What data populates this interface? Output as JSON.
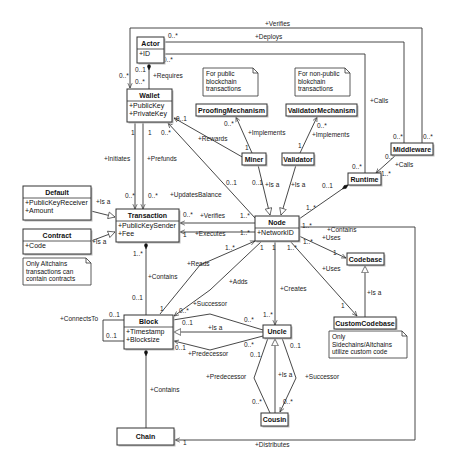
{
  "diagram": {
    "type": "UML class diagram",
    "classes": [
      {
        "id": "actor",
        "name": "Actor",
        "attributes": [
          "+ID"
        ],
        "x": 137,
        "y": 37,
        "w": 27,
        "h": 26
      },
      {
        "id": "wallet",
        "name": "Wallet",
        "attributes": [
          "+PublicKey",
          "+PrivateKey"
        ],
        "x": 127,
        "y": 89,
        "w": 45,
        "h": 33
      },
      {
        "id": "proofing",
        "name": "ProofingMechanism",
        "attributes": [],
        "x": 196,
        "y": 104,
        "w": 71,
        "h": 12
      },
      {
        "id": "validatormech",
        "name": "ValidatorMechanism",
        "attributes": [],
        "x": 286,
        "y": 104,
        "w": 71,
        "h": 12
      },
      {
        "id": "miner",
        "name": "Miner",
        "attributes": [],
        "x": 242,
        "y": 153,
        "w": 24,
        "h": 12
      },
      {
        "id": "validator",
        "name": "Validator",
        "attributes": [],
        "x": 282,
        "y": 153,
        "w": 32,
        "h": 12
      },
      {
        "id": "middleware",
        "name": "Middleware",
        "attributes": [],
        "x": 391,
        "y": 143,
        "w": 42,
        "h": 12
      },
      {
        "id": "runtime",
        "name": "Runtime",
        "attributes": [],
        "x": 348,
        "y": 173,
        "w": 33,
        "h": 12
      },
      {
        "id": "default",
        "name": "Default",
        "attributes": [
          "+PublicKeyReceiver",
          "+Amount"
        ],
        "x": 23,
        "y": 186,
        "w": 68,
        "h": 34
      },
      {
        "id": "transaction",
        "name": "Transaction",
        "attributes": [
          "+PublicKeySender",
          "+Fee"
        ],
        "x": 116,
        "y": 209,
        "w": 63,
        "h": 33
      },
      {
        "id": "contract",
        "name": "Contract",
        "attributes": [
          "+Code"
        ],
        "x": 23,
        "y": 229,
        "w": 68,
        "h": 25
      },
      {
        "id": "node",
        "name": "Node",
        "attributes": [
          "+NetworkID"
        ],
        "x": 255,
        "y": 216,
        "w": 44,
        "h": 25
      },
      {
        "id": "codebase",
        "name": "Codebase",
        "attributes": [],
        "x": 347,
        "y": 253,
        "w": 37,
        "h": 12
      },
      {
        "id": "customcodebase",
        "name": "CustomCodebase",
        "attributes": [],
        "x": 334,
        "y": 317,
        "w": 62,
        "h": 12
      },
      {
        "id": "block",
        "name": "Block",
        "attributes": [
          "+Timestamp",
          "+Blocksize"
        ],
        "x": 124,
        "y": 315,
        "w": 49,
        "h": 34
      },
      {
        "id": "uncle",
        "name": "Uncle",
        "attributes": [],
        "x": 263,
        "y": 325,
        "w": 28,
        "h": 13
      },
      {
        "id": "cousin",
        "name": "Cousin",
        "attributes": [],
        "x": 261,
        "y": 413,
        "w": 27,
        "h": 13
      },
      {
        "id": "chain",
        "name": "Chain",
        "attributes": [],
        "x": 117,
        "y": 428,
        "w": 57,
        "h": 17
      }
    ],
    "notes": [
      {
        "id": "note-public",
        "lines": [
          "For public",
          "blockchain",
          "transactions"
        ],
        "x": 203,
        "y": 68,
        "w": 55,
        "h": 28
      },
      {
        "id": "note-nonpublic",
        "lines": [
          "For non-public",
          "blokchain",
          "transactions"
        ],
        "x": 295,
        "y": 68,
        "w": 55,
        "h": 28
      },
      {
        "id": "note-altchains",
        "lines": [
          "Only Altchains",
          "transactions can",
          "contain contracts"
        ],
        "x": 23,
        "y": 258,
        "w": 68,
        "h": 27
      },
      {
        "id": "note-sidechains",
        "lines": [
          "Only",
          "Sidechains/Altchains",
          "utilize custom code"
        ],
        "x": 329,
        "y": 331,
        "w": 78,
        "h": 27
      }
    ],
    "edges": [
      {
        "id": "verifies-top",
        "label": "+Verifies",
        "label_x": 265,
        "label_y": 26,
        "mults": [
          {
            "t": "0..*",
            "x": 168,
            "y": 38
          },
          {
            "t": "0..*",
            "x": 423,
            "y": 139
          }
        ]
      },
      {
        "id": "deploys",
        "label": "+Deploys",
        "label_x": 255,
        "label_y": 39,
        "mults": [
          {
            "t": "0..*",
            "x": 163,
            "y": 62
          },
          {
            "t": "0..*",
            "x": 393,
            "y": 139
          }
        ]
      },
      {
        "id": "calls-runtime",
        "label": "+Calls",
        "label_x": 370,
        "label_y": 103,
        "mults": [
          {
            "t": "0..*",
            "x": 352,
            "y": 169
          }
        ]
      },
      {
        "id": "calls-mw",
        "label": "+Calls",
        "label_x": 395,
        "label_y": 167,
        "mults": [
          {
            "t": "0..*",
            "x": 385,
            "y": 159
          },
          {
            "t": "1..*",
            "x": 381,
            "y": 176
          }
        ]
      },
      {
        "id": "requires",
        "label": "+Requires",
        "label_x": 153,
        "label_y": 78,
        "mults": [
          {
            "t": "0..1",
            "x": 135,
            "y": 72
          },
          {
            "t": "0..*",
            "x": 135,
            "y": 84
          },
          {
            "t": "0..*",
            "x": 119,
            "y": 78
          }
        ]
      },
      {
        "id": "implements-pm",
        "label": "+Implements",
        "label_x": 248,
        "label_y": 135,
        "mults": [
          {
            "t": "0..*",
            "x": 224,
            "y": 126
          },
          {
            "t": "1",
            "x": 245,
            "y": 150
          }
        ]
      },
      {
        "id": "implements-vm",
        "label": "+Implements",
        "label_x": 312,
        "label_y": 137,
        "mults": [
          {
            "t": "0..*",
            "x": 317,
            "y": 128
          },
          {
            "t": "1",
            "x": 298,
            "y": 148
          }
        ]
      },
      {
        "id": "rewards",
        "label": "+Rewards",
        "label_x": 198,
        "label_y": 141,
        "mults": [
          {
            "t": "0..1",
            "x": 176,
            "y": 121
          },
          {
            "t": "0..1",
            "x": 226,
            "y": 185
          }
        ]
      },
      {
        "id": "initiates",
        "label": "+Initiates",
        "label_x": 104,
        "label_y": 161,
        "mults": [
          {
            "t": "1",
            "x": 131,
            "y": 135
          },
          {
            "t": "0..*",
            "x": 125,
            "y": 198
          }
        ]
      },
      {
        "id": "prefunds",
        "label": "+Prefunds",
        "label_x": 147,
        "label_y": 161,
        "mults": [
          {
            "t": "1",
            "x": 148,
            "y": 135
          },
          {
            "t": "0..*",
            "x": 148,
            "y": 198
          }
        ]
      },
      {
        "id": "updatesbalance",
        "label": "+UpdatesBalance",
        "label_x": 170,
        "label_y": 197,
        "mults": [
          {
            "t": "0..*",
            "x": 161,
            "y": 135
          },
          {
            "t": "0..1",
            "x": 252,
            "y": 185
          }
        ]
      },
      {
        "id": "miner-isa",
        "label": "+Is a",
        "label_x": 265,
        "label_y": 187
      },
      {
        "id": "validator-isa",
        "label": "+Is a",
        "label_x": 291,
        "label_y": 187
      },
      {
        "id": "contains-runtime",
        "label": "+Contains",
        "label_x": 327,
        "label_y": 232,
        "mults": [
          {
            "t": "0..1",
            "x": 322,
            "y": 188
          },
          {
            "t": "1..*",
            "x": 306,
            "y": 210
          }
        ]
      },
      {
        "id": "default-isa",
        "label": "+Is a",
        "label_x": 96,
        "label_y": 204
      },
      {
        "id": "contract-isa",
        "label": "+Is a",
        "label_x": 92,
        "label_y": 244
      },
      {
        "id": "verifies-node",
        "label": "+Verifies",
        "label_x": 200,
        "label_y": 218,
        "mults": [
          {
            "t": "0..*",
            "x": 183,
            "y": 217
          },
          {
            "t": "1..*",
            "x": 240,
            "y": 218
          }
        ]
      },
      {
        "id": "executes",
        "label": "+Executes",
        "label_x": 195,
        "label_y": 236,
        "mults": [
          {
            "t": "1",
            "x": 183,
            "y": 237
          },
          {
            "t": "1..*",
            "x": 240,
            "y": 235
          }
        ]
      },
      {
        "id": "uses-codebase",
        "label": "+Uses",
        "label_x": 322,
        "label_y": 240,
        "mults": [
          {
            "t": "1..*",
            "x": 303,
            "y": 244
          },
          {
            "t": "1",
            "x": 333,
            "y": 255
          }
        ]
      },
      {
        "id": "uses-custom",
        "label": "+Uses",
        "label_x": 322,
        "label_y": 271,
        "mults": [
          {
            "t": "1..*",
            "x": 302,
            "y": 228
          },
          {
            "t": "1",
            "x": 341,
            "y": 308
          }
        ]
      },
      {
        "id": "custom-isa",
        "label": "+Is a",
        "label_x": 367,
        "label_y": 295
      },
      {
        "id": "contains-tx",
        "label": "+Contains",
        "label_x": 148,
        "label_y": 279,
        "mults": [
          {
            "t": "1..*",
            "x": 133,
            "y": 256
          },
          {
            "t": "0..1",
            "x": 132,
            "y": 300
          }
        ]
      },
      {
        "id": "reads",
        "label": "+Reads",
        "label_x": 187,
        "label_y": 266,
        "mults": [
          {
            "t": "1",
            "x": 160,
            "y": 311
          },
          {
            "t": "1..*",
            "x": 225,
            "y": 250
          }
        ]
      },
      {
        "id": "adds",
        "label": "+Adds",
        "label_x": 229,
        "label_y": 284,
        "mults": [
          {
            "t": "1",
            "x": 260,
            "y": 250
          }
        ]
      },
      {
        "id": "creates",
        "label": "+Creates",
        "label_x": 280,
        "label_y": 291,
        "mults": [
          {
            "t": "1",
            "x": 272,
            "y": 250
          },
          {
            "t": "1..*",
            "x": 263,
            "y": 317
          }
        ]
      },
      {
        "id": "node-codebase-mult",
        "mults": [
          {
            "t": "1..*",
            "x": 287,
            "y": 250
          }
        ]
      },
      {
        "id": "connectsto",
        "label": "+ConnectsTo",
        "label_x": 60,
        "label_y": 321,
        "mults": [
          {
            "t": "0..1",
            "x": 109,
            "y": 317
          },
          {
            "t": "0..1",
            "x": 106,
            "y": 338
          }
        ]
      },
      {
        "id": "successor-block",
        "label": "+Successor",
        "label_x": 193,
        "label_y": 306,
        "mults": [
          {
            "t": "0..*",
            "x": 179,
            "y": 313
          },
          {
            "t": "0..*",
            "x": 244,
            "y": 322
          }
        ]
      },
      {
        "id": "uncle-isa-block",
        "label": "+Is a",
        "label_x": 208,
        "label_y": 330,
        "mults": [
          {
            "t": "0..1",
            "x": 182,
            "y": 325
          }
        ]
      },
      {
        "id": "predecessor-block",
        "label": "+Predecessor",
        "label_x": 188,
        "label_y": 356,
        "mults": [
          {
            "t": "0..1",
            "x": 175,
            "y": 350
          },
          {
            "t": "0..*",
            "x": 244,
            "y": 347
          }
        ]
      },
      {
        "id": "predecessor-uncle",
        "label": "+Predecessor",
        "label_x": 206,
        "label_y": 379,
        "mults": [
          {
            "t": "0..1",
            "x": 250,
            "y": 357
          },
          {
            "t": "0..*",
            "x": 252,
            "y": 404
          }
        ]
      },
      {
        "id": "cousin-isa",
        "label": "+Is a",
        "label_x": 278,
        "label_y": 377
      },
      {
        "id": "successor-uncle",
        "label": "+Successor",
        "label_x": 305,
        "label_y": 379,
        "mults": [
          {
            "t": "0..1",
            "x": 290,
            "y": 348
          },
          {
            "t": "0..*",
            "x": 283,
            "y": 404
          }
        ]
      },
      {
        "id": "contains-block",
        "label": "+Contains",
        "label_x": 150,
        "label_y": 392
      },
      {
        "id": "distributes",
        "label": "+Distributes",
        "label_x": 255,
        "label_y": 447,
        "mults": [
          {
            "t": "1",
            "x": 183,
            "y": 445
          }
        ]
      }
    ]
  }
}
